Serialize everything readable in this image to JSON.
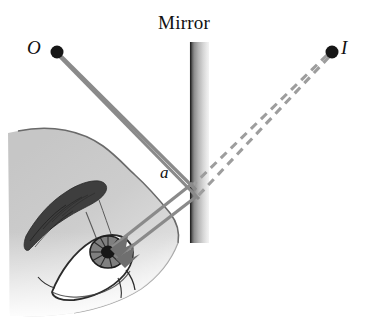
{
  "figure": {
    "labels": {
      "mirror": "Mirror",
      "object_point": "O",
      "image_point": "I",
      "angle": "a"
    },
    "colors": {
      "background": "#ffffff",
      "ray_solid": "#8a8a8a",
      "ray_dashed": "#9a9a9a",
      "point_dot": "#1a1a1a",
      "mirror_dark": "#3a3a3a",
      "mirror_light": "#efefef",
      "face_fill": "#cfcfcf",
      "face_outline": "#6e6e6e",
      "eyebrow": "#3c3c3c",
      "label_text": "#111111"
    },
    "geometry": {
      "mirror": {
        "x_left": 190,
        "x_right": 209,
        "y_top": 42,
        "y_bottom": 243,
        "orientation": "vertical"
      },
      "object_point": {
        "x": 57,
        "y": 52
      },
      "image_point": {
        "x": 332,
        "y": 52
      },
      "reflection_point": {
        "x": 190,
        "y": 185
      },
      "eye_point": {
        "x": 108,
        "y": 252
      }
    },
    "elements": [
      {
        "name": "incident-ray-1",
        "style": "solid",
        "from": "O",
        "to": "mirror"
      },
      {
        "name": "incident-ray-2",
        "style": "solid",
        "from": "O",
        "to": "mirror"
      },
      {
        "name": "reflected-ray-1",
        "style": "solid",
        "from": "mirror",
        "to": "eye"
      },
      {
        "name": "reflected-ray-2",
        "style": "solid",
        "from": "mirror",
        "to": "eye"
      },
      {
        "name": "virtual-ray-1",
        "style": "dashed",
        "from": "mirror",
        "to": "I"
      },
      {
        "name": "virtual-ray-2",
        "style": "dashed",
        "from": "mirror",
        "to": "I"
      },
      {
        "name": "face-profile",
        "style": "filled-silhouette"
      },
      {
        "name": "eye",
        "style": "line-drawing"
      }
    ]
  }
}
